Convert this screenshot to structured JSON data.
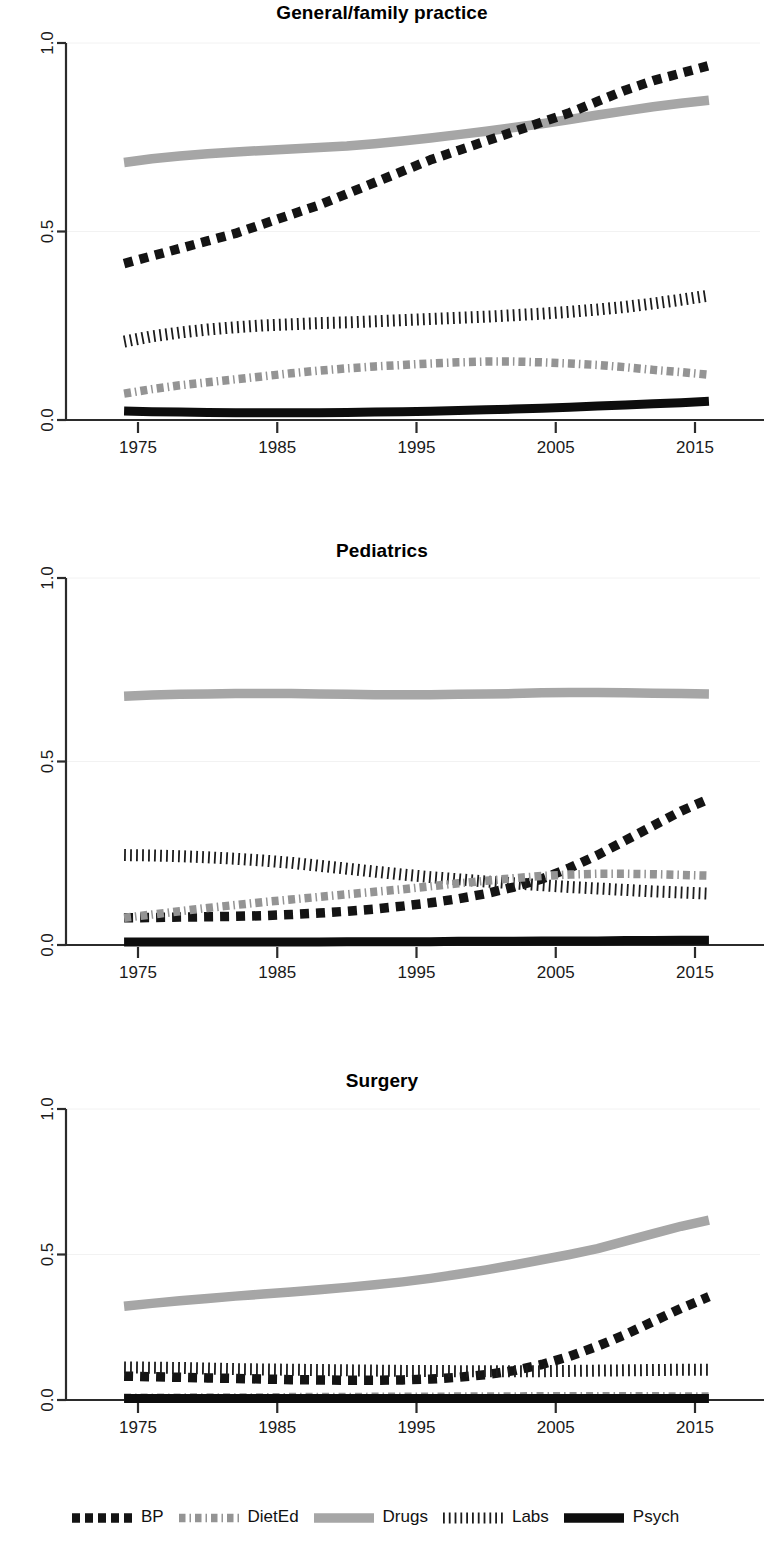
{
  "figure": {
    "panels": [
      "General/family practice",
      "Pediatrics",
      "Surgery"
    ],
    "legend_labels": [
      "BP",
      "DietEd",
      "Drugs",
      "Labs",
      "Psych"
    ]
  },
  "legend": {
    "items": [
      {
        "label": "BP",
        "style": "dashed-square-black",
        "color": "#111111",
        "icon": "legend-swatch-bp"
      },
      {
        "label": "DietEd",
        "style": "dash-dot-gray",
        "color": "#8c8c8c",
        "icon": "legend-swatch-dieted"
      },
      {
        "label": "Drugs",
        "style": "solid-thick-gray",
        "color": "#a3a3a3",
        "icon": "legend-swatch-drugs"
      },
      {
        "label": "Labs",
        "style": "vertical-hatch-black",
        "color": "#1a1a1a",
        "icon": "legend-swatch-labs"
      },
      {
        "label": "Psych",
        "style": "solid-thick-black",
        "color": "#111111",
        "icon": "legend-swatch-psych"
      }
    ]
  },
  "axes": {
    "y_ticks": [
      "0.0",
      "0.5",
      "1.0"
    ],
    "x_ticks": [
      "1975",
      "1985",
      "1995",
      "2005",
      "2015"
    ],
    "ylim": [
      0,
      1
    ],
    "xlim": [
      1973,
      2016
    ]
  },
  "chart_data": [
    {
      "type": "line",
      "title": "General/family practice",
      "xlabel": "",
      "ylabel": "",
      "ylim": [
        0,
        1
      ],
      "xlim": [
        1973,
        2016
      ],
      "grid": true,
      "legend_position": "bottom",
      "x": [
        1974,
        1976,
        1978,
        1980,
        1982,
        1984,
        1986,
        1988,
        1990,
        1992,
        1994,
        1996,
        1998,
        2000,
        2002,
        2004,
        2006,
        2008,
        2010,
        2012,
        2014,
        2016
      ],
      "series": [
        {
          "name": "BP",
          "values": [
            0.415,
            0.435,
            0.455,
            0.475,
            0.495,
            0.52,
            0.545,
            0.57,
            0.6,
            0.63,
            0.66,
            0.69,
            0.715,
            0.74,
            0.765,
            0.79,
            0.815,
            0.845,
            0.875,
            0.9,
            0.92,
            0.94
          ]
        },
        {
          "name": "DietEd",
          "values": [
            0.07,
            0.082,
            0.092,
            0.1,
            0.108,
            0.116,
            0.124,
            0.131,
            0.137,
            0.142,
            0.146,
            0.15,
            0.153,
            0.155,
            0.155,
            0.153,
            0.15,
            0.146,
            0.14,
            0.133,
            0.127,
            0.12
          ]
        },
        {
          "name": "Drugs",
          "values": [
            0.683,
            0.693,
            0.7,
            0.706,
            0.711,
            0.715,
            0.719,
            0.723,
            0.727,
            0.733,
            0.74,
            0.748,
            0.757,
            0.766,
            0.776,
            0.786,
            0.797,
            0.809,
            0.82,
            0.831,
            0.84,
            0.848
          ]
        },
        {
          "name": "Labs",
          "values": [
            0.208,
            0.222,
            0.232,
            0.24,
            0.246,
            0.251,
            0.254,
            0.257,
            0.259,
            0.262,
            0.265,
            0.268,
            0.271,
            0.274,
            0.278,
            0.282,
            0.287,
            0.293,
            0.3,
            0.309,
            0.319,
            0.33
          ]
        },
        {
          "name": "Psych",
          "values": [
            0.024,
            0.022,
            0.021,
            0.02,
            0.019,
            0.019,
            0.019,
            0.019,
            0.02,
            0.021,
            0.022,
            0.023,
            0.025,
            0.027,
            0.029,
            0.031,
            0.034,
            0.037,
            0.04,
            0.043,
            0.046,
            0.05
          ]
        }
      ]
    },
    {
      "type": "line",
      "title": "Pediatrics",
      "xlabel": "",
      "ylabel": "",
      "ylim": [
        0,
        1
      ],
      "xlim": [
        1973,
        2016
      ],
      "grid": true,
      "legend_position": "bottom",
      "x": [
        1974,
        1976,
        1978,
        1980,
        1982,
        1984,
        1986,
        1988,
        1990,
        1992,
        1994,
        1996,
        1998,
        2000,
        2002,
        2004,
        2006,
        2008,
        2010,
        2012,
        2014,
        2016
      ],
      "series": [
        {
          "name": "BP",
          "values": [
            0.074,
            0.075,
            0.076,
            0.077,
            0.078,
            0.08,
            0.083,
            0.087,
            0.092,
            0.098,
            0.106,
            0.115,
            0.126,
            0.14,
            0.158,
            0.18,
            0.21,
            0.245,
            0.285,
            0.325,
            0.365,
            0.398
          ]
        },
        {
          "name": "DietEd",
          "values": [
            0.074,
            0.083,
            0.092,
            0.101,
            0.109,
            0.117,
            0.124,
            0.131,
            0.138,
            0.145,
            0.152,
            0.16,
            0.168,
            0.175,
            0.182,
            0.188,
            0.192,
            0.194,
            0.194,
            0.193,
            0.191,
            0.189
          ]
        },
        {
          "name": "Drugs",
          "values": [
            0.678,
            0.681,
            0.683,
            0.684,
            0.685,
            0.685,
            0.685,
            0.684,
            0.683,
            0.682,
            0.682,
            0.682,
            0.683,
            0.684,
            0.685,
            0.687,
            0.688,
            0.688,
            0.687,
            0.686,
            0.685,
            0.684
          ]
        },
        {
          "name": "Labs",
          "values": [
            0.245,
            0.244,
            0.242,
            0.239,
            0.235,
            0.23,
            0.224,
            0.216,
            0.208,
            0.2,
            0.192,
            0.185,
            0.179,
            0.173,
            0.168,
            0.163,
            0.158,
            0.154,
            0.15,
            0.146,
            0.143,
            0.14
          ]
        },
        {
          "name": "Psych",
          "values": [
            0.008,
            0.008,
            0.008,
            0.008,
            0.008,
            0.008,
            0.008,
            0.008,
            0.009,
            0.009,
            0.009,
            0.009,
            0.01,
            0.01,
            0.01,
            0.011,
            0.011,
            0.011,
            0.012,
            0.012,
            0.013,
            0.013
          ]
        }
      ]
    },
    {
      "type": "line",
      "title": "Surgery",
      "xlabel": "",
      "ylabel": "",
      "ylim": [
        0,
        1
      ],
      "xlim": [
        1973,
        2016
      ],
      "grid": true,
      "legend_position": "bottom",
      "x": [
        1974,
        1976,
        1978,
        1980,
        1982,
        1984,
        1986,
        1988,
        1990,
        1992,
        1994,
        1996,
        1998,
        2000,
        2002,
        2004,
        2006,
        2008,
        2010,
        2012,
        2014,
        2016
      ],
      "series": [
        {
          "name": "BP",
          "values": [
            0.082,
            0.08,
            0.078,
            0.076,
            0.074,
            0.072,
            0.07,
            0.069,
            0.068,
            0.068,
            0.069,
            0.072,
            0.078,
            0.087,
            0.101,
            0.122,
            0.15,
            0.185,
            0.225,
            0.27,
            0.315,
            0.355
          ]
        },
        {
          "name": "DietEd",
          "values": [
            0.008,
            0.008,
            0.008,
            0.009,
            0.009,
            0.009,
            0.01,
            0.01,
            0.01,
            0.011,
            0.011,
            0.011,
            0.012,
            0.012,
            0.012,
            0.013,
            0.013,
            0.013,
            0.013,
            0.013,
            0.012,
            0.012
          ]
        },
        {
          "name": "Drugs",
          "values": [
            0.322,
            0.332,
            0.341,
            0.349,
            0.357,
            0.364,
            0.371,
            0.379,
            0.387,
            0.396,
            0.406,
            0.418,
            0.432,
            0.447,
            0.464,
            0.482,
            0.5,
            0.52,
            0.546,
            0.572,
            0.597,
            0.618
          ]
        },
        {
          "name": "Labs",
          "values": [
            0.112,
            0.111,
            0.11,
            0.108,
            0.106,
            0.105,
            0.104,
            0.103,
            0.102,
            0.101,
            0.1,
            0.1,
            0.099,
            0.099,
            0.099,
            0.099,
            0.1,
            0.101,
            0.102,
            0.103,
            0.104,
            0.104
          ]
        },
        {
          "name": "Psych",
          "values": [
            0.005,
            0.005,
            0.005,
            0.005,
            0.005,
            0.005,
            0.005,
            0.005,
            0.005,
            0.005,
            0.005,
            0.005,
            0.005,
            0.005,
            0.005,
            0.005,
            0.005,
            0.005,
            0.005,
            0.005,
            0.005,
            0.005
          ]
        }
      ]
    }
  ]
}
